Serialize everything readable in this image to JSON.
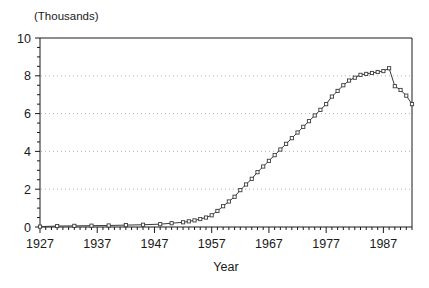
{
  "chart_data": {
    "type": "line",
    "title": "",
    "unit_note": "(Thousands)",
    "xlabel": "Year",
    "ylabel": "",
    "xlim": [
      1927,
      1992
    ],
    "ylim": [
      0,
      10
    ],
    "xticks": [
      1927,
      1937,
      1947,
      1957,
      1967,
      1977,
      1987
    ],
    "xtick_labels": [
      "1927",
      "1937",
      "1947",
      "1957",
      "1967",
      "1977",
      "1987"
    ],
    "yticks": [
      0,
      2,
      4,
      6,
      8,
      10
    ],
    "ytick_labels": [
      "0",
      "2",
      "4",
      "6",
      "8",
      "10"
    ],
    "y_minor_tick_step": 0.5,
    "x_minor_tick_step": 1,
    "grid": "horizontal-dotted",
    "gridlines": [
      2,
      4,
      6,
      8
    ],
    "legend": "none",
    "marker": "open-square",
    "line_color": "#3a3a3a",
    "marker_color": "#3a3a3a",
    "axis_color": "#1a1a1a",
    "grid_color": "#b4b4b4",
    "background_color": "#ffffff",
    "x": [
      1927,
      1930,
      1933,
      1936,
      1939,
      1942,
      1945,
      1948,
      1950,
      1952,
      1953,
      1954,
      1955,
      1956,
      1957,
      1958,
      1959,
      1960,
      1961,
      1962,
      1963,
      1964,
      1965,
      1966,
      1967,
      1968,
      1969,
      1970,
      1971,
      1972,
      1973,
      1974,
      1975,
      1976,
      1977,
      1978,
      1979,
      1980,
      1981,
      1982,
      1983,
      1984,
      1985,
      1986,
      1987,
      1988,
      1989,
      1990,
      1991,
      1992
    ],
    "values": [
      0.02,
      0.05,
      0.06,
      0.07,
      0.08,
      0.1,
      0.12,
      0.15,
      0.2,
      0.25,
      0.3,
      0.35,
      0.42,
      0.5,
      0.62,
      0.85,
      1.1,
      1.35,
      1.6,
      1.95,
      2.25,
      2.55,
      2.9,
      3.2,
      3.5,
      3.8,
      4.1,
      4.4,
      4.7,
      5.0,
      5.3,
      5.6,
      5.9,
      6.2,
      6.5,
      6.9,
      7.2,
      7.5,
      7.75,
      7.9,
      8.05,
      8.1,
      8.15,
      8.2,
      8.25,
      8.4,
      7.45,
      7.25,
      6.95,
      6.5
    ]
  }
}
